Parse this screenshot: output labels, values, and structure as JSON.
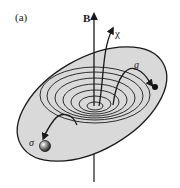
{
  "figure": {
    "panel_label": "(a)",
    "labels": {
      "field": "B",
      "chi": "χ",
      "g": "g",
      "sigma": "σ"
    },
    "colors": {
      "ellipse_fill": "#d9d9d9",
      "line": "#1a1a1a",
      "background": "#ffffff"
    }
  }
}
